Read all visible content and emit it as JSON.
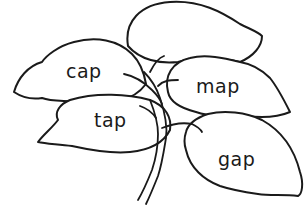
{
  "illustration": {
    "subject": "plant-with-leaves",
    "line_color": "#1a1a1a",
    "background": "#ffffff",
    "leaves": [
      {
        "id": "cap",
        "word": "cap"
      },
      {
        "id": "map",
        "word": "map"
      },
      {
        "id": "tap",
        "word": "tap"
      },
      {
        "id": "gap",
        "word": "gap"
      },
      {
        "id": "top",
        "word": ""
      }
    ]
  }
}
